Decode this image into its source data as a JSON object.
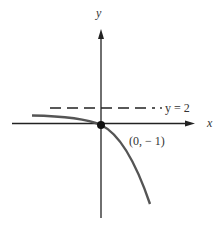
{
  "diagram": {
    "x_axis_label": "x",
    "y_axis_label": "y",
    "asymptote_label": "y = 2",
    "point_label": "(0, − 1)",
    "curve_color": "#555555",
    "axis_color": "#222222"
  }
}
